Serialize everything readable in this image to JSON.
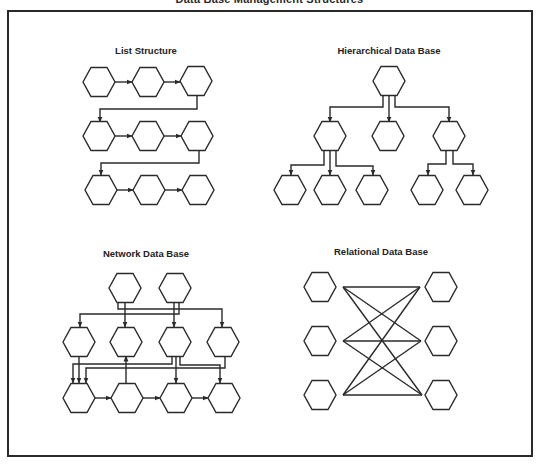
{
  "title": "Data Base Management Structures",
  "style": {
    "stroke": "#2a2a2a",
    "fill": "#ffffff",
    "hex_w": 32,
    "hex_h": 29
  },
  "panels": [
    {
      "id": "list",
      "label": "List Structure",
      "label_pos": [
        146,
        45
      ],
      "nodes": [
        {
          "id": "l1",
          "x": 99,
          "y": 82
        },
        {
          "id": "l2",
          "x": 148,
          "y": 82
        },
        {
          "id": "l3",
          "x": 196,
          "y": 81
        },
        {
          "id": "l4",
          "x": 99,
          "y": 136
        },
        {
          "id": "l5",
          "x": 148,
          "y": 136
        },
        {
          "id": "l6",
          "x": 197,
          "y": 136
        },
        {
          "id": "l7",
          "x": 101,
          "y": 190
        },
        {
          "id": "l8",
          "x": 149,
          "y": 190
        },
        {
          "id": "l9",
          "x": 198,
          "y": 190
        }
      ],
      "edges": [
        {
          "pts": [
            [
              115,
              82
            ],
            [
              132,
              82
            ]
          ],
          "arrow": true
        },
        {
          "pts": [
            [
              164,
              82
            ],
            [
              180,
              82
            ]
          ],
          "arrow": true
        },
        {
          "pts": [
            [
              197,
              96
            ],
            [
              197,
              109
            ],
            [
              100,
              109
            ],
            [
              100,
              122
            ]
          ],
          "arrow": true
        },
        {
          "pts": [
            [
              115,
              136
            ],
            [
              132,
              136
            ]
          ],
          "arrow": true
        },
        {
          "pts": [
            [
              164,
              136
            ],
            [
              181,
              136
            ]
          ],
          "arrow": true
        },
        {
          "pts": [
            [
              199,
              151
            ],
            [
              199,
              163
            ],
            [
              101,
              163
            ],
            [
              101,
              175
            ]
          ],
          "arrow": true
        },
        {
          "pts": [
            [
              117,
              190
            ],
            [
              133,
              190
            ]
          ],
          "arrow": true
        },
        {
          "pts": [
            [
              165,
              190
            ],
            [
              182,
              190
            ]
          ],
          "arrow": true
        }
      ]
    },
    {
      "id": "hierarchical",
      "label": "Hierarchical Data Base",
      "label_pos": [
        389,
        45
      ],
      "nodes": [
        {
          "id": "h_root",
          "x": 389,
          "y": 81
        },
        {
          "id": "h_a",
          "x": 330,
          "y": 136
        },
        {
          "id": "h_b",
          "x": 388,
          "y": 136
        },
        {
          "id": "h_c",
          "x": 449,
          "y": 136
        },
        {
          "id": "h_a1",
          "x": 290,
          "y": 190
        },
        {
          "id": "h_a2",
          "x": 330,
          "y": 190
        },
        {
          "id": "h_a3",
          "x": 372,
          "y": 190
        },
        {
          "id": "h_c1",
          "x": 427,
          "y": 190
        },
        {
          "id": "h_c2",
          "x": 472,
          "y": 190
        }
      ],
      "edges": [
        {
          "pts": [
            [
              383,
              95
            ],
            [
              383,
              107
            ],
            [
              330,
              107
            ],
            [
              330,
              122
            ]
          ],
          "arrow": true
        },
        {
          "pts": [
            [
              389,
              95
            ],
            [
              389,
              122
            ]
          ],
          "arrow": true
        },
        {
          "pts": [
            [
              395,
              95
            ],
            [
              395,
              107
            ],
            [
              449,
              107
            ],
            [
              449,
              122
            ]
          ],
          "arrow": true
        },
        {
          "pts": [
            [
              324,
              151
            ],
            [
              324,
              165
            ],
            [
              291,
              165
            ],
            [
              291,
              175
            ]
          ],
          "arrow": true
        },
        {
          "pts": [
            [
              330,
              151
            ],
            [
              330,
              175
            ]
          ],
          "arrow": true
        },
        {
          "pts": [
            [
              336,
              151
            ],
            [
              336,
              166
            ],
            [
              373,
              166
            ],
            [
              373,
              175
            ]
          ],
          "arrow": true
        },
        {
          "pts": [
            [
              446,
              151
            ],
            [
              446,
              164
            ],
            [
              428,
              164
            ],
            [
              428,
              175
            ]
          ],
          "arrow": true
        },
        {
          "pts": [
            [
              453,
              151
            ],
            [
              453,
              164
            ],
            [
              473,
              164
            ],
            [
              473,
              175
            ]
          ],
          "arrow": true
        }
      ]
    },
    {
      "id": "network",
      "label": "Network Data Base",
      "label_pos": [
        146,
        248
      ],
      "nodes": [
        {
          "id": "n_t1",
          "x": 125,
          "y": 288
        },
        {
          "id": "n_t2",
          "x": 175,
          "y": 288
        },
        {
          "id": "n_m1",
          "x": 79,
          "y": 342
        },
        {
          "id": "n_m2",
          "x": 126,
          "y": 342
        },
        {
          "id": "n_m3",
          "x": 175,
          "y": 342
        },
        {
          "id": "n_m4",
          "x": 223,
          "y": 342
        },
        {
          "id": "n_b1",
          "x": 79,
          "y": 398
        },
        {
          "id": "n_b2",
          "x": 127,
          "y": 398
        },
        {
          "id": "n_b3",
          "x": 176,
          "y": 398
        },
        {
          "id": "n_b4",
          "x": 224,
          "y": 398
        }
      ],
      "edges": [
        {
          "pts": [
            [
              118,
              302
            ],
            [
              118,
              309
            ],
            [
              222,
              309
            ],
            [
              222,
              327
            ]
          ],
          "arrow": true
        },
        {
          "pts": [
            [
              125,
              302
            ],
            [
              125,
              327
            ]
          ],
          "arrow": true
        },
        {
          "pts": [
            [
              174,
              302
            ],
            [
              174,
              327
            ]
          ],
          "arrow": true
        },
        {
          "pts": [
            [
              179,
              302
            ],
            [
              179,
              314
            ],
            [
              80,
              314
            ],
            [
              80,
              327
            ]
          ],
          "arrow": true
        },
        {
          "pts": [
            [
              79,
              356
            ],
            [
              79,
              383
            ]
          ],
          "arrow": true
        },
        {
          "pts": [
            [
              172,
              356
            ],
            [
              172,
              364
            ],
            [
              73,
              364
            ],
            [
              73,
              383
            ]
          ],
          "arrow": true
        },
        {
          "pts": [
            [
              176,
              356
            ],
            [
              176,
              383
            ]
          ],
          "arrow": true
        },
        {
          "pts": [
            [
              180,
              356
            ],
            [
              180,
              365
            ],
            [
              220,
              365
            ],
            [
              220,
              383
            ]
          ],
          "arrow": true
        },
        {
          "pts": [
            [
              225,
              356
            ],
            [
              225,
              368
            ],
            [
              86,
              368
            ],
            [
              86,
              383
            ]
          ],
          "arrow": true
        },
        {
          "pts": [
            [
              126,
              383
            ],
            [
              126,
              356
            ]
          ],
          "arrow": true
        },
        {
          "pts": [
            [
              95,
              398
            ],
            [
              111,
              398
            ]
          ],
          "arrow": true
        },
        {
          "pts": [
            [
              143,
              398
            ],
            [
              160,
              398
            ]
          ],
          "arrow": true
        },
        {
          "pts": [
            [
              192,
              398
            ],
            [
              208,
              398
            ]
          ],
          "arrow": true
        }
      ]
    },
    {
      "id": "relational",
      "label": "Relational Data Base",
      "label_pos": [
        381,
        246
      ],
      "nodes": [
        {
          "id": "r_l1",
          "x": 320,
          "y": 287
        },
        {
          "id": "r_l2",
          "x": 320,
          "y": 341
        },
        {
          "id": "r_l3",
          "x": 320,
          "y": 395
        },
        {
          "id": "r_r1",
          "x": 441,
          "y": 287
        },
        {
          "id": "r_r2",
          "x": 441,
          "y": 341
        },
        {
          "id": "r_r3",
          "x": 441,
          "y": 395
        }
      ],
      "edges": [
        {
          "pts": [
            [
              343,
              287
            ],
            [
              420,
              287
            ]
          ],
          "arrow": false
        },
        {
          "pts": [
            [
              343,
              287
            ],
            [
              421,
              341
            ]
          ],
          "arrow": false
        },
        {
          "pts": [
            [
              343,
              287
            ],
            [
              422,
              395
            ]
          ],
          "arrow": false
        },
        {
          "pts": [
            [
              343,
              341
            ],
            [
              420,
              287
            ]
          ],
          "arrow": false
        },
        {
          "pts": [
            [
              343,
              341
            ],
            [
              421,
              341
            ]
          ],
          "arrow": false
        },
        {
          "pts": [
            [
              343,
              341
            ],
            [
              422,
              395
            ]
          ],
          "arrow": false
        },
        {
          "pts": [
            [
              343,
              395
            ],
            [
              420,
              287
            ]
          ],
          "arrow": false
        },
        {
          "pts": [
            [
              343,
              395
            ],
            [
              421,
              341
            ]
          ],
          "arrow": false
        },
        {
          "pts": [
            [
              343,
              395
            ],
            [
              422,
              395
            ]
          ],
          "arrow": false
        }
      ]
    }
  ]
}
